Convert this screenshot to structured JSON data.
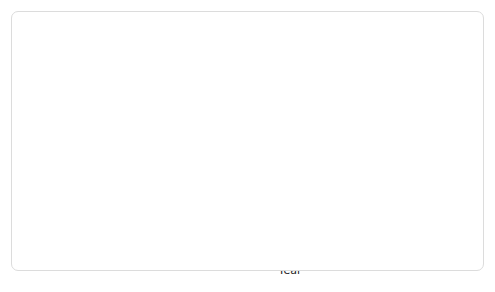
{
  "figure": {
    "background": "#ffffff",
    "card_border": "#dcdcdc"
  },
  "chart_data": {
    "type": "line",
    "title": "",
    "xlabel": "Year",
    "ylabel": "Percentage of patients with recurrent heart attacks (cumulative average)",
    "ylabel_lines": [
      "Percentage",
      "of patients",
      "with recurrent",
      "heart attacks",
      "(cumulative",
      "average)"
    ],
    "ylim": [
      0,
      6.6
    ],
    "xlim": [
      1977.75,
      1982.25
    ],
    "yticks": [
      0,
      1,
      2,
      3,
      4,
      5,
      6
    ],
    "ytick_labels": [
      "0",
      "1",
      "2",
      "3",
      "4",
      "5",
      "6%"
    ],
    "xticks": [
      1978,
      1979,
      1980,
      1981,
      1982
    ],
    "xtick_labels": [
      "1978",
      "1979",
      "1980",
      "1981",
      "1982"
    ],
    "minor_xticks_per_year": 4,
    "grid": true,
    "grid_color": "#c9c9c9",
    "plot_background": "#fafafa",
    "legend_position": "inline-callouts",
    "series": [
      {
        "name": "Control patients",
        "color": "#a7a7a7",
        "x": [
          1977.9,
          1978.15,
          1978.4,
          1978.65,
          1978.9,
          1979.15,
          1979.4,
          1979.65,
          1979.9,
          1980.15,
          1980.4,
          1980.65,
          1980.9,
          1981.15,
          1981.4,
          1981.65,
          1981.9,
          1982.05
        ],
        "values": [
          3.3,
          1.7,
          2.35,
          3.05,
          3.9,
          3.4,
          3.45,
          4.1,
          4.75,
          4.7,
          4.5,
          4.3,
          5.2,
          5.95,
          5.8,
          5.9,
          6.05,
          6.1
        ]
      },
      {
        "name": "Life-style modification patients",
        "color": "#c9c9c9",
        "x": [
          1977.9,
          1978.15,
          1978.4,
          1978.65,
          1978.9,
          1979.15,
          1979.4,
          1979.65,
          1979.9,
          1980.15,
          1980.4,
          1980.65,
          1980.9,
          1981.15,
          1981.4,
          1981.65,
          1981.9,
          1982.05
        ],
        "values": [
          3.3,
          2.85,
          3.1,
          3.5,
          3.02,
          3.05,
          3.12,
          3.3,
          3.55,
          3.3,
          3.05,
          2.92,
          2.9,
          2.98,
          2.75,
          2.8,
          2.82,
          2.95
        ]
      }
    ],
    "annotations": [
      {
        "name": "control-patients-callout",
        "text": "Control patients",
        "style": "bold",
        "text_xy": [
          1978.85,
          5.62
        ],
        "leader_to": [
          1979.72,
          4.42
        ]
      },
      {
        "name": "lifestyle-callout",
        "text": "Life-style modification patients",
        "style": "bold",
        "text_xy": [
          1979.05,
          1.48
        ],
        "leader_to": [
          1979.45,
          3.16
        ]
      },
      {
        "name": "reduction-note",
        "text_lines": [
          "Modifying life-style",
          "reduced recurrent",
          "heart attacks"
        ],
        "text_xy": [
          1981.05,
          4.72
        ]
      },
      {
        "name": "double-headed-arrow",
        "color": "#111111",
        "x": 1982.08,
        "y_top": 6.08,
        "y_bottom": 2.95
      }
    ]
  }
}
